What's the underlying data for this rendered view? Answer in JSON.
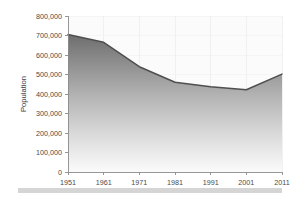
{
  "chart_data": {
    "type": "area",
    "title": "",
    "xlabel": "",
    "ylabel": "Population",
    "categories": [
      "1951",
      "1961",
      "1971",
      "1981",
      "1991",
      "2001",
      "2011"
    ],
    "x": [
      1951,
      1961,
      1971,
      1981,
      1991,
      2001,
      2011
    ],
    "values": [
      705000,
      665000,
      540000,
      460000,
      437000,
      422000,
      502000
    ],
    "series": [
      {
        "name": "Population",
        "values": [
          705000,
          665000,
          540000,
          460000,
          437000,
          422000,
          502000
        ]
      }
    ],
    "ylim": [
      0,
      800000
    ],
    "xlim": [
      1951,
      2011
    ],
    "ytick_labels": [
      "0",
      "100,000",
      "200,000",
      "300,000",
      "400,000",
      "500,000",
      "600,000",
      "700,000",
      "800,000"
    ],
    "ytick_values": [
      0,
      100000,
      200000,
      300000,
      400000,
      500000,
      600000,
      700000,
      800000
    ],
    "xtick_labels": [
      "1951",
      "1961",
      "1971",
      "1981",
      "1991",
      "2001",
      "2011"
    ],
    "grid": true,
    "legend": false,
    "legend_position": "none",
    "colors": {
      "line": "#4f4f4f",
      "area_top": "#757575",
      "area_bottom": "#fcfcfc",
      "axis": "#8c8c8c",
      "text": "#4a4a4a",
      "plot_background": "#fbfbfb",
      "page_background": "#ffffff",
      "gridline": "#eeeeee",
      "footer_bar": "#d5d5d5"
    }
  },
  "axes": {
    "y_title": "Population"
  },
  "footer": {
    "bar_label": "footer-bar"
  }
}
